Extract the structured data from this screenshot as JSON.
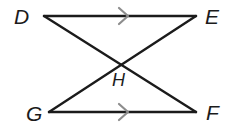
{
  "figure": {
    "background_color": "#ffffff",
    "line_color": "#1b1b1b",
    "line_width": 2.4,
    "tick_color": "#8d8d8d",
    "label_color": "#1b1b1b"
  },
  "points": [
    {
      "name": "D",
      "label": "D",
      "x": 44,
      "y": 16,
      "label_x": 14,
      "label_y": 24
    },
    {
      "name": "E",
      "label": "E",
      "x": 196,
      "y": 16,
      "label_x": 205,
      "label_y": 24
    },
    {
      "name": "G",
      "label": "G",
      "x": 49,
      "y": 112,
      "label_x": 26,
      "label_y": 121
    },
    {
      "name": "F",
      "label": "F",
      "x": 196,
      "y": 112,
      "label_x": 206,
      "label_y": 120
    },
    {
      "name": "H",
      "label": "H",
      "x": 118,
      "y": 63,
      "label_x": 112,
      "label_y": 86
    }
  ],
  "segments": [
    {
      "name": "segment-DE",
      "from": "D",
      "to": "E",
      "x1": 44,
      "y1": 16,
      "x2": 196,
      "y2": 16,
      "parallel_ticks": 1
    },
    {
      "name": "segment-GF",
      "from": "G",
      "to": "F",
      "x1": 49,
      "y1": 112,
      "x2": 196,
      "y2": 112,
      "parallel_ticks": 1
    },
    {
      "name": "segment-DF",
      "from": "D",
      "to": "F",
      "x1": 44,
      "y1": 16,
      "x2": 196,
      "y2": 112,
      "parallel_ticks": 0
    },
    {
      "name": "segment-GE",
      "from": "G",
      "to": "E",
      "x1": 49,
      "y1": 112,
      "x2": 196,
      "y2": 16,
      "parallel_ticks": 0
    }
  ],
  "parallel_marks": [
    {
      "name": "parallel-mark-top",
      "on_segment": "segment-DE",
      "x": 128,
      "y": 16,
      "direction": "right",
      "size": 9
    },
    {
      "name": "parallel-mark-bottom",
      "on_segment": "segment-GF",
      "x": 128,
      "y": 112,
      "direction": "right",
      "size": 9
    }
  ]
}
